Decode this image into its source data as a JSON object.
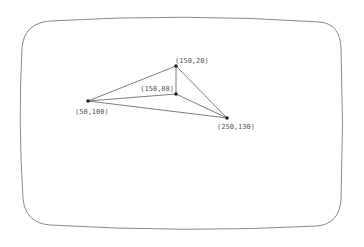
{
  "diagram": {
    "title": "",
    "frame": {
      "shape": "rounded-rectangle",
      "stroke": "#8a8a8a"
    },
    "points": [
      {
        "id": "p1",
        "label": "(150,20)",
        "coords": [
          150,
          20
        ],
        "px": [
          176,
          66
        ],
        "label_pos": [
          175,
          63
        ],
        "anchor": "start"
      },
      {
        "id": "p2",
        "label": "(150,80)",
        "coords": [
          150,
          80
        ],
        "px": [
          176,
          94
        ],
        "label_pos": [
          174,
          91
        ],
        "anchor": "end"
      },
      {
        "id": "p3",
        "label": "(50,100)",
        "coords": [
          50,
          100
        ],
        "px": [
          88,
          101
        ],
        "label_pos": [
          75,
          114
        ],
        "anchor": "start"
      },
      {
        "id": "p4",
        "label": "(250,130)",
        "coords": [
          250,
          130
        ],
        "px": [
          227,
          118
        ],
        "label_pos": [
          217,
          129
        ],
        "anchor": "start"
      }
    ],
    "edges": [
      [
        "p3",
        "p1"
      ],
      [
        "p1",
        "p4"
      ],
      [
        "p1",
        "p2"
      ],
      [
        "p3",
        "p2"
      ],
      [
        "p2",
        "p4"
      ],
      [
        "p3",
        "p4"
      ]
    ],
    "colors": {
      "edge": "#6e6e6e",
      "point": "#222222",
      "label": "#555555"
    }
  }
}
